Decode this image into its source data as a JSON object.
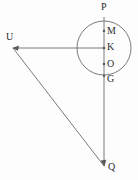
{
  "figure": {
    "background_color": "#fdfdfd",
    "stroke_color": "#6b6b6b",
    "label_color": "#2b2b2b",
    "width": 138,
    "height": 180
  },
  "labels": {
    "p": "P",
    "m": "M",
    "k": "K",
    "o": "O",
    "g": "G",
    "u": "U",
    "q": "Q"
  },
  "geometry": {
    "circle": {
      "cx": 104,
      "cy": 48,
      "r": 27
    },
    "points": {
      "P": {
        "x": 104,
        "y": 17
      },
      "M": {
        "x": 104,
        "y": 31
      },
      "K": {
        "x": 104,
        "y": 48
      },
      "O": {
        "x": 104,
        "y": 64
      },
      "G": {
        "x": 104,
        "y": 76
      },
      "U": {
        "x": 13,
        "y": 48
      },
      "Q": {
        "x": 104,
        "y": 166
      }
    },
    "segments": [
      {
        "name": "vertical-P-to-Q",
        "from": "P",
        "to": "Q"
      },
      {
        "name": "horizontal-U-to-K",
        "from": "U",
        "to": "K"
      },
      {
        "name": "diagonal-U-to-Q",
        "from": "U",
        "to": "Q"
      }
    ],
    "label_positions": {
      "P": {
        "x": 101,
        "y": 2
      },
      "M": {
        "x": 107,
        "y": 26
      },
      "K": {
        "x": 107,
        "y": 42
      },
      "O": {
        "x": 107,
        "y": 59
      },
      "G": {
        "x": 107,
        "y": 74
      },
      "U": {
        "x": 6,
        "y": 32
      },
      "Q": {
        "x": 108,
        "y": 162
      }
    }
  }
}
